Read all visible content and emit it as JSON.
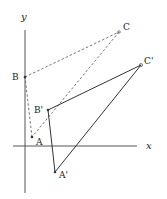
{
  "diagram": {
    "type": "coordinate-geometry-transformation",
    "axes": {
      "x_label": "x",
      "y_label": "y",
      "color": "#555555"
    },
    "original_triangle": {
      "style": "dashed",
      "color": "#666666",
      "points": {
        "A": {
          "label": "A",
          "x": 32,
          "y": 137,
          "lx": 36,
          "ly": 145
        },
        "B": {
          "label": "B",
          "x": 25,
          "y": 77,
          "lx": 12,
          "ly": 80
        },
        "C": {
          "label": "C",
          "x": 119,
          "y": 32,
          "lx": 123,
          "ly": 30
        }
      }
    },
    "image_triangle": {
      "style": "solid",
      "color": "#333333",
      "points": {
        "A": {
          "label": "A'",
          "x": 55,
          "y": 172,
          "lx": 59,
          "ly": 178
        },
        "B": {
          "label": "B'",
          "x": 48,
          "y": 110,
          "lx": 34,
          "ly": 113
        },
        "C": {
          "label": "C'",
          "x": 141,
          "y": 65,
          "lx": 144,
          "ly": 64
        }
      }
    }
  }
}
